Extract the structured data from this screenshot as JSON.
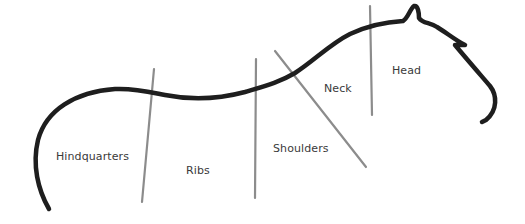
{
  "diagram": {
    "colors": {
      "outline": "#1e1e1e",
      "divider": "#8c8c8c",
      "label": "#3a3a3a",
      "background": "#ffffff"
    },
    "labels": [
      {
        "id": "hindquarters",
        "text": "Hindquarters"
      },
      {
        "id": "ribs",
        "text": "Ribs"
      },
      {
        "id": "shoulders",
        "text": "Shoulders"
      },
      {
        "id": "neck",
        "text": "Neck"
      },
      {
        "id": "head",
        "text": "Head"
      }
    ]
  }
}
